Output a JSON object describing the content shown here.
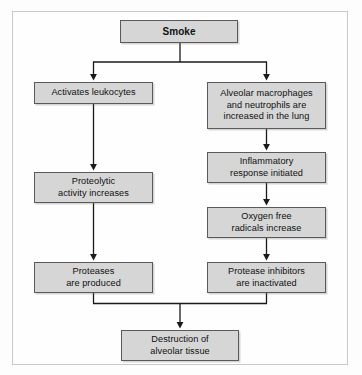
{
  "diagram": {
    "frame": {
      "border_color": "#c9c9c9",
      "background": "#fefefe"
    },
    "style": {
      "node_fill": "#d6d6d6",
      "node_border": "#5a5a5a",
      "connector_color": "#1a1a1a",
      "text_color": "#101010"
    },
    "nodes": [
      {
        "id": "smoke",
        "label": "Smoke",
        "emphasis": "bold"
      },
      {
        "id": "leukocytes",
        "label": "Activates leukocytes",
        "emphasis": "normal"
      },
      {
        "id": "macrophages",
        "label": "Alveolar macrophages\nand neutrophils are\nincreased in the lung",
        "emphasis": "normal"
      },
      {
        "id": "proteolytic",
        "label": "Proteolytic\nactivity increases",
        "emphasis": "normal"
      },
      {
        "id": "inflammatory",
        "label": "Inflammatory\nresponse initiated",
        "emphasis": "normal"
      },
      {
        "id": "oxygen",
        "label": "Oxygen free\nradicals increase",
        "emphasis": "normal"
      },
      {
        "id": "proteases",
        "label": "Proteases\nare produced",
        "emphasis": "normal"
      },
      {
        "id": "inhibitors",
        "label": "Protease inhibitors\nare inactivated",
        "emphasis": "normal"
      },
      {
        "id": "destruction",
        "label": "Destruction of\nalveolar tissue",
        "emphasis": "normal"
      }
    ],
    "edges": [
      {
        "from": "smoke",
        "to": "leukocytes",
        "type": "split-arrow"
      },
      {
        "from": "smoke",
        "to": "macrophages",
        "type": "split-arrow"
      },
      {
        "from": "leukocytes",
        "to": "proteolytic",
        "type": "arrow"
      },
      {
        "from": "macrophages",
        "to": "inflammatory",
        "type": "arrow"
      },
      {
        "from": "proteolytic",
        "to": "proteases",
        "type": "arrow"
      },
      {
        "from": "inflammatory",
        "to": "oxygen",
        "type": "arrow"
      },
      {
        "from": "oxygen",
        "to": "inhibitors",
        "type": "arrow"
      },
      {
        "from": "proteases",
        "to": "destruction",
        "type": "merge-arrow"
      },
      {
        "from": "inhibitors",
        "to": "destruction",
        "type": "merge-arrow"
      }
    ]
  }
}
